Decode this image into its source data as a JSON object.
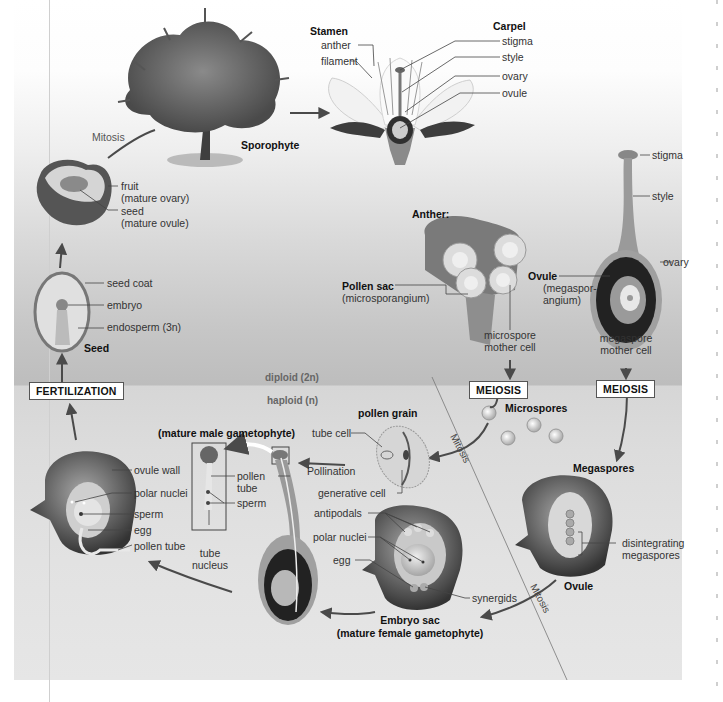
{
  "diagram": {
    "regions": {
      "diploid": "diploid (2n)",
      "haploid": "haploid (n)"
    },
    "process_boxes": {
      "fertilization": "FERTILIZATION",
      "meiosis_male": "MEIOSIS",
      "meiosis_female": "MEIOSIS"
    },
    "processes": {
      "mitosis_top": "Mitosis",
      "mitosis_microspore": "Mitosis",
      "mitosis_megaspore": "Mitosis",
      "pollination": "Pollination"
    },
    "sporophyte": {
      "label": "Sporophyte"
    },
    "flower": {
      "stamen_heading": "Stamen",
      "stamen_parts": [
        "anther",
        "filament"
      ],
      "carpel_heading": "Carpel",
      "carpel_parts": [
        "stigma",
        "style",
        "ovary",
        "ovule"
      ]
    },
    "fruit": {
      "labels": [
        "fruit",
        "(mature ovary)",
        "seed",
        "(mature ovule)"
      ]
    },
    "seed": {
      "heading": "Seed",
      "labels": [
        "seed coat",
        "embryo",
        "endosperm (3n)"
      ]
    },
    "anther": {
      "heading": "Anther:",
      "pollen_sac": "Pollen sac",
      "pollen_sac_sub": "(microsporangium)",
      "microspore_mother_cell": [
        "microspore",
        "mother cell"
      ]
    },
    "carpel_detail": {
      "labels": [
        "stigma",
        "style",
        "ovary"
      ],
      "ovule": "Ovule",
      "ovule_sub": [
        "(megaspor-",
        "angium)"
      ],
      "megaspore_mother_cell": [
        "megaspore",
        "mother cell"
      ]
    },
    "microspores": {
      "label": "Microspores"
    },
    "megaspores": {
      "label": "Megaspores"
    },
    "pollen_grain": {
      "heading": "pollen grain",
      "labels": [
        "tube cell",
        "generative cell"
      ]
    },
    "male_gametophyte": {
      "heading": "(mature male gametophyte)",
      "labels": [
        "pollen",
        "tube",
        "sperm"
      ],
      "tube_nucleus": [
        "tube",
        "nucleus"
      ]
    },
    "fertilized_ovule": {
      "labels": [
        "ovule wall",
        "polar nuclei",
        "sperm",
        "egg",
        "pollen tube"
      ]
    },
    "embryo_sac": {
      "labels": [
        "antipodals",
        "polar nuclei",
        "egg",
        "synergids"
      ],
      "heading": "Embryo sac",
      "heading_sub": "(mature female gametophyte)"
    },
    "ovule_megaspores": {
      "labels": [
        "disintegrating",
        "megaspores"
      ],
      "heading": "Ovule"
    },
    "colors": {
      "arrow": "#4a4a4a",
      "box_border": "#555555",
      "diploid_band": "#bdbdbd",
      "haploid_band": "#d6d6d6"
    }
  }
}
